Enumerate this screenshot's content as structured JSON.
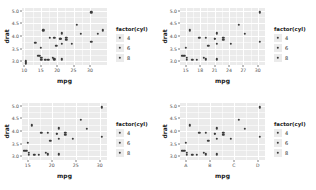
{
  "figure": {
    "panel_count": 4,
    "theme": "grey",
    "panel_fill": "#ebebeb",
    "gridline_color": "#ffffff",
    "point_color": "#3b3b3b",
    "background": "#ffffff"
  },
  "legend": {
    "title": "factor(cyl)",
    "entries": [
      {
        "label": "4"
      },
      {
        "label": "6"
      },
      {
        "label": "8"
      }
    ]
  },
  "chart_data": [
    {
      "type": "scatter",
      "title": "",
      "xlabel": "mpg",
      "ylabel": "drat",
      "xlim": [
        9.3,
        35.2
      ],
      "ylim": [
        2.86,
        5.1
      ],
      "xticks": [
        "10",
        "15",
        "20",
        "25",
        "30"
      ],
      "xtickvalues": [
        10,
        15,
        20,
        25,
        30
      ],
      "yticks": [
        "3.0",
        "3.5",
        "4.0",
        "4.5",
        "5.0"
      ],
      "ytickvalues": [
        3.0,
        3.5,
        4.0,
        4.5,
        5.0
      ],
      "grid": true,
      "legend_position": "right",
      "legend_title": "factor(cyl)",
      "x": [
        21.0,
        21.0,
        22.8,
        21.4,
        18.7,
        18.1,
        14.3,
        24.4,
        22.8,
        19.2,
        17.8,
        16.4,
        17.3,
        15.2,
        10.4,
        10.4,
        14.7,
        32.4,
        30.4,
        33.9,
        21.5,
        15.5,
        15.2,
        13.3,
        19.2,
        27.3,
        26.0,
        30.4,
        15.8,
        19.7,
        15.0,
        21.4
      ],
      "y": [
        3.9,
        3.9,
        3.85,
        3.08,
        3.15,
        2.76,
        3.21,
        3.69,
        3.92,
        3.92,
        3.92,
        3.07,
        3.07,
        3.07,
        2.93,
        3.0,
        3.23,
        4.08,
        4.93,
        4.22,
        3.7,
        2.76,
        3.15,
        3.73,
        3.08,
        4.08,
        4.43,
        3.77,
        4.22,
        3.62,
        3.54,
        4.11
      ]
    },
    {
      "type": "scatter",
      "title": "",
      "xlabel": "mpg",
      "ylabel": "drat",
      "xlim": [
        13.8,
        31.5
      ],
      "ylim": [
        2.86,
        5.1
      ],
      "xticks": [
        "15",
        "18",
        "21",
        "24",
        "27",
        "30"
      ],
      "xtickvalues": [
        15,
        18,
        21,
        24,
        27,
        30
      ],
      "yticks": [
        "3.0",
        "3.5",
        "4.0",
        "4.5",
        "5.0"
      ],
      "ytickvalues": [
        3.0,
        3.5,
        4.0,
        4.5,
        5.0
      ],
      "grid": true,
      "legend_position": "right",
      "legend_title": "factor(cyl)",
      "x": [
        21.0,
        21.0,
        22.8,
        21.4,
        18.7,
        18.1,
        14.3,
        24.4,
        22.8,
        19.2,
        17.8,
        16.4,
        17.3,
        15.2,
        14.7,
        30.4,
        21.5,
        15.5,
        15.2,
        19.2,
        27.3,
        26.0,
        30.4,
        15.8,
        19.7,
        15.0,
        21.4
      ],
      "y": [
        3.9,
        3.9,
        3.85,
        3.08,
        3.15,
        2.76,
        3.21,
        3.69,
        3.92,
        3.92,
        3.92,
        3.07,
        3.07,
        3.07,
        3.23,
        4.93,
        3.7,
        2.76,
        3.15,
        3.08,
        4.08,
        4.43,
        3.77,
        4.22,
        3.62,
        3.54,
        4.11
      ]
    },
    {
      "type": "scatter",
      "title": "",
      "xlabel": "mpg",
      "ylabel": "drat",
      "xlim": [
        13.8,
        31.5
      ],
      "ylim": [
        2.86,
        5.1
      ],
      "xticks": [
        "15",
        "20",
        "25",
        "30"
      ],
      "xtickvalues": [
        15,
        20,
        25,
        30
      ],
      "yticks": [
        "3.0",
        "3.5",
        "4.0",
        "4.5",
        "5.0"
      ],
      "ytickvalues": [
        3.0,
        3.5,
        4.0,
        4.5,
        5.0
      ],
      "grid": true,
      "legend_position": "right",
      "legend_title": "factor(cyl)",
      "x": [
        21.0,
        21.0,
        22.8,
        21.4,
        18.7,
        18.1,
        14.3,
        24.4,
        22.8,
        19.2,
        17.8,
        16.4,
        17.3,
        15.2,
        14.7,
        30.4,
        21.5,
        15.5,
        15.2,
        19.2,
        27.3,
        26.0,
        30.4,
        15.8,
        19.7,
        15.0,
        21.4
      ],
      "y": [
        3.9,
        3.9,
        3.85,
        3.08,
        3.15,
        2.76,
        3.21,
        3.69,
        3.92,
        3.92,
        3.92,
        3.07,
        3.07,
        3.07,
        3.23,
        4.93,
        3.7,
        2.76,
        3.15,
        3.08,
        4.08,
        4.43,
        3.77,
        4.22,
        3.62,
        3.54,
        4.11
      ]
    },
    {
      "type": "scatter",
      "title": "",
      "xlabel": "mpg",
      "ylabel": "drat",
      "xlim": [
        13.8,
        31.5
      ],
      "ylim": [
        2.86,
        5.1
      ],
      "xticks": [
        "A",
        "B",
        "C",
        "D"
      ],
      "xtickvalues": [
        15,
        20,
        25,
        30
      ],
      "yticks": [
        "3.0",
        "3.5",
        "4.0",
        "4.5",
        "5.0"
      ],
      "ytickvalues": [
        3.0,
        3.5,
        4.0,
        4.5,
        5.0
      ],
      "grid": true,
      "legend_position": "right",
      "legend_title": "factor(cyl)",
      "x": [
        21.0,
        21.0,
        22.8,
        21.4,
        18.7,
        18.1,
        14.3,
        24.4,
        22.8,
        19.2,
        17.8,
        16.4,
        17.3,
        15.2,
        14.7,
        30.4,
        21.5,
        15.5,
        15.2,
        19.2,
        27.3,
        26.0,
        30.4,
        15.8,
        19.7,
        15.0,
        21.4
      ],
      "y": [
        3.9,
        3.9,
        3.85,
        3.08,
        3.15,
        2.76,
        3.21,
        3.69,
        3.92,
        3.92,
        3.92,
        3.07,
        3.07,
        3.07,
        3.23,
        4.93,
        3.7,
        2.76,
        3.15,
        3.08,
        4.08,
        4.43,
        3.77,
        4.22,
        3.62,
        3.54,
        4.11
      ]
    }
  ]
}
